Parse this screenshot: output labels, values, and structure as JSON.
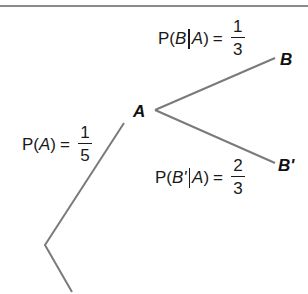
{
  "diagram": {
    "type": "probability-tree",
    "line_color": "#7a7a7a",
    "top_rule_color": "#8a8a8a",
    "nodes": {
      "a": "A",
      "b": "B",
      "b_prime": "B'"
    },
    "edges": {
      "root_to_a": {
        "prob_prefix": "P(",
        "event": "A",
        "prob_suffix": ")",
        "equals": "=",
        "numerator": "1",
        "denominator": "5"
      },
      "a_to_b": {
        "prob_prefix": "P(",
        "event": "B",
        "given": "A",
        "prob_suffix": ")",
        "equals": "=",
        "numerator": "1",
        "denominator": "3"
      },
      "a_to_b_prime": {
        "prob_prefix": "P(",
        "event": "B'",
        "given": "A",
        "prob_suffix": ")",
        "equals": "=",
        "numerator": "2",
        "denominator": "3"
      }
    }
  }
}
